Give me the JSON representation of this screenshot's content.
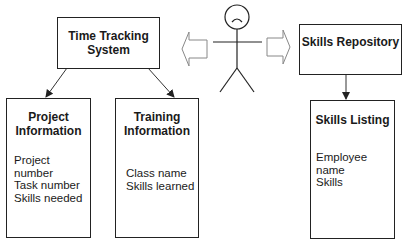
{
  "diagram": {
    "actor": {
      "icon": "stick-figure-sad-face"
    },
    "nodes": {
      "time_tracking": {
        "title_line1": "Time Tracking",
        "title_line2": "System"
      },
      "skills_repository": {
        "title": "Skills Repository"
      },
      "project_information": {
        "title_line1": "Project",
        "title_line2": "Information",
        "items": [
          "Project number",
          "Task number",
          "Skills needed"
        ]
      },
      "training_information": {
        "title_line1": "Training",
        "title_line2": "Information",
        "items": [
          "Class name",
          "Skills learned"
        ]
      },
      "skills_listing": {
        "title": "Skills Listing",
        "items": [
          "Employee name",
          "Skills"
        ]
      }
    },
    "edges": [
      {
        "from": "actor",
        "to": "time_tracking",
        "style": "hollow-block-arrow"
      },
      {
        "from": "actor",
        "to": "skills_repository",
        "style": "hollow-block-arrow"
      },
      {
        "from": "time_tracking",
        "to": "project_information",
        "style": "line-arrow"
      },
      {
        "from": "time_tracking",
        "to": "training_information",
        "style": "line-arrow"
      },
      {
        "from": "skills_repository",
        "to": "skills_listing",
        "style": "line-arrow"
      }
    ]
  }
}
